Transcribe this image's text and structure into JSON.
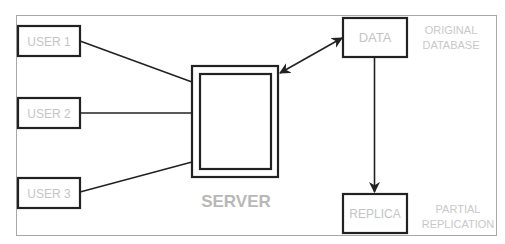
{
  "diagram": {
    "users": [
      {
        "label": "USER 1"
      },
      {
        "label": "USER 2"
      },
      {
        "label": "USER 3"
      }
    ],
    "server": {
      "label": "SERVER"
    },
    "data_node": {
      "label": "DATA",
      "annotation_line1": "ORIGINAL",
      "annotation_line2": "DATABASE"
    },
    "replica_node": {
      "label": "REPLICA",
      "annotation_line1": "PARTIAL",
      "annotation_line2": "REPLICATION"
    },
    "edges": [
      {
        "from": "USER 1",
        "to": "SERVER",
        "type": "line"
      },
      {
        "from": "USER 2",
        "to": "SERVER",
        "type": "line"
      },
      {
        "from": "USER 3",
        "to": "SERVER",
        "type": "line"
      },
      {
        "from": "SERVER",
        "to": "DATA",
        "type": "bidirectional-arrow"
      },
      {
        "from": "DATA",
        "to": "REPLICA",
        "type": "arrow"
      }
    ]
  }
}
